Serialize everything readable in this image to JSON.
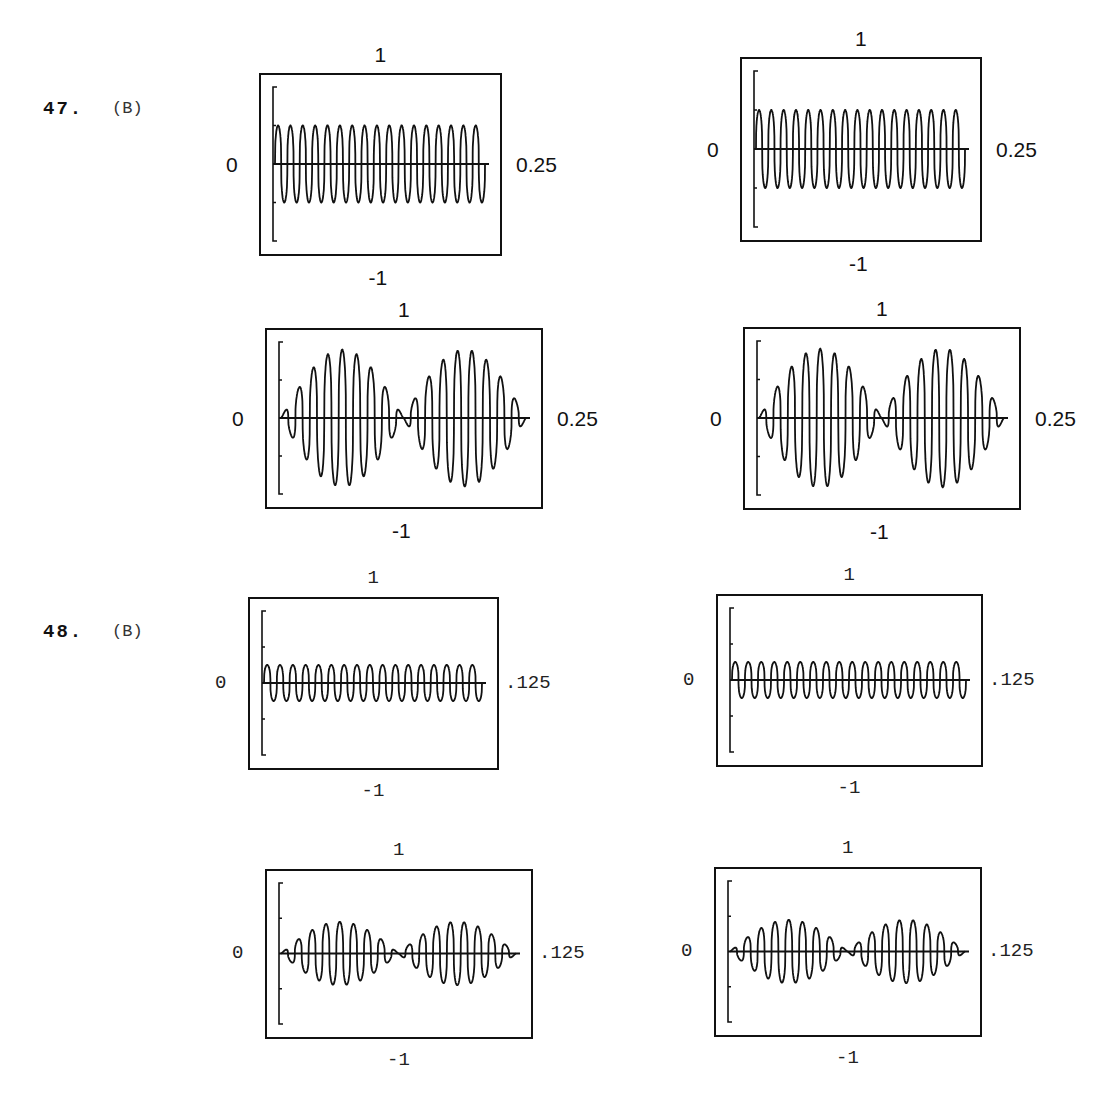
{
  "questions": [
    {
      "number": "47.",
      "answer": "(B)"
    },
    {
      "number": "48.",
      "answer": "(B)"
    }
  ],
  "chart_data": [
    {
      "id": "47-top-left",
      "type": "line",
      "question": "47",
      "ymax_label": "1",
      "ymin_label": "-1",
      "xmin_label": "0",
      "xmax_label": "0.25",
      "ylim": [
        -1,
        1
      ],
      "xlim": [
        0,
        0.25
      ],
      "envelope": "constant",
      "amplitude": 0.5,
      "cycles": 17,
      "description": "aliased sampled sinusoid, constant amplitude ~0.5"
    },
    {
      "id": "47-top-right",
      "type": "line",
      "question": "47",
      "ymax_label": "1",
      "ymin_label": "-1",
      "xmin_label": "0",
      "xmax_label": "0.25",
      "ylim": [
        -1,
        1
      ],
      "xlim": [
        0,
        0.25
      ],
      "envelope": "constant",
      "amplitude": 0.5,
      "cycles": 17,
      "description": "aliased sampled sinusoid, constant amplitude ~0.5"
    },
    {
      "id": "47-bottom-left",
      "type": "line",
      "question": "47",
      "ymax_label": "1",
      "ymin_label": "-1",
      "xmin_label": "0",
      "xmax_label": "0.25",
      "ylim": [
        -1,
        1
      ],
      "xlim": [
        0,
        0.25
      ],
      "envelope": "beat",
      "amplitude": 0.9,
      "cycles": 17,
      "beats": 2,
      "description": "beat pattern with two lobes, peak amplitude ~0.9"
    },
    {
      "id": "47-bottom-right",
      "type": "line",
      "question": "47",
      "ymax_label": "1",
      "ymin_label": "-1",
      "xmin_label": "0",
      "xmax_label": "0.25",
      "ylim": [
        -1,
        1
      ],
      "xlim": [
        0,
        0.25
      ],
      "envelope": "beat",
      "amplitude": 0.9,
      "cycles": 17,
      "beats": 2,
      "description": "beat pattern with two lobes, peak amplitude ~0.9"
    },
    {
      "id": "48-top-left",
      "type": "line",
      "question": "48",
      "ymax_label": "1",
      "ymin_label": "-1",
      "xmin_label": "0",
      "xmax_label": ".125",
      "ylim": [
        -1,
        1
      ],
      "xlim": [
        0,
        0.125
      ],
      "envelope": "constant",
      "amplitude": 0.25,
      "cycles": 17,
      "description": "aliased sampled sinusoid, constant amplitude ~0.25"
    },
    {
      "id": "48-top-right",
      "type": "line",
      "question": "48",
      "ymax_label": "1",
      "ymin_label": "-1",
      "xmin_label": "0",
      "xmax_label": ".125",
      "ylim": [
        -1,
        1
      ],
      "xlim": [
        0,
        0.125
      ],
      "envelope": "constant",
      "amplitude": 0.25,
      "cycles": 18,
      "description": "aliased sampled sinusoid, constant amplitude ~0.25"
    },
    {
      "id": "48-bottom-left",
      "type": "line",
      "question": "48",
      "ymax_label": "1",
      "ymin_label": "-1",
      "xmin_label": "0",
      "xmax_label": ".125",
      "ylim": [
        -1,
        1
      ],
      "xlim": [
        0,
        0.125
      ],
      "envelope": "beat",
      "amplitude": 0.45,
      "cycles": 17,
      "beats": 2,
      "description": "beat pattern with two lobes, peak amplitude ~0.45"
    },
    {
      "id": "48-bottom-right",
      "type": "line",
      "question": "48",
      "ymax_label": "1",
      "ymin_label": "-1",
      "xmin_label": "0",
      "xmax_label": ".125",
      "ylim": [
        -1,
        1
      ],
      "xlim": [
        0,
        0.125
      ],
      "envelope": "beat",
      "amplitude": 0.45,
      "cycles": 17,
      "beats": 2,
      "description": "beat pattern with two lobes, peak amplitude ~0.45"
    }
  ]
}
